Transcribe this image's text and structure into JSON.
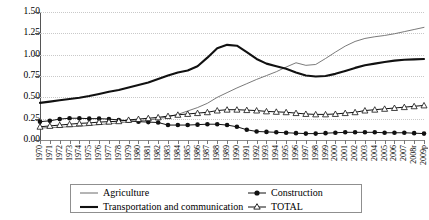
{
  "chart_data": {
    "type": "line",
    "title": "",
    "xlabel": "",
    "ylabel": "",
    "ylim": [
      0.0,
      1.5
    ],
    "yticks": [
      "0.00",
      "0.25",
      "0.50",
      "0.75",
      "1.00",
      "1.25",
      "1.50"
    ],
    "ytick_values": [
      0.0,
      0.25,
      0.5,
      0.75,
      1.0,
      1.25,
      1.5
    ],
    "grid": true,
    "legend_position": "bottom",
    "categories": [
      "1970",
      "1971",
      "1972",
      "1973",
      "1974",
      "1975",
      "1976",
      "1977",
      "1978",
      "1979",
      "1980",
      "1981",
      "1982",
      "1983",
      "1984",
      "1985",
      "1986",
      "1987",
      "1988",
      "1989",
      "1990",
      "1991",
      "1992",
      "1993",
      "1994",
      "1995",
      "1996",
      "1997",
      "1998",
      "1999",
      "2000",
      "2001",
      "2002",
      "2003",
      "2004",
      "2005",
      "2006",
      "2007",
      "2008r",
      "2009p"
    ],
    "series": [
      {
        "name": "Agriculture",
        "style": "thin-line",
        "color": "#6b6b6b",
        "marker": "none",
        "values": [
          0.14,
          0.145,
          0.15,
          0.155,
          0.16,
          0.17,
          0.18,
          0.19,
          0.2,
          0.215,
          0.225,
          0.235,
          0.25,
          0.27,
          0.3,
          0.34,
          0.38,
          0.43,
          0.5,
          0.555,
          0.61,
          0.66,
          0.71,
          0.755,
          0.8,
          0.855,
          0.905,
          0.875,
          0.885,
          0.955,
          1.03,
          1.1,
          1.155,
          1.19,
          1.21,
          1.225,
          1.245,
          1.27,
          1.295,
          1.32
        ]
      },
      {
        "name": "Construction",
        "style": "line-marker",
        "color": "#111111",
        "marker": "filled-circle",
        "values": [
          0.215,
          0.225,
          0.245,
          0.255,
          0.255,
          0.25,
          0.25,
          0.245,
          0.235,
          0.225,
          0.215,
          0.21,
          0.205,
          0.175,
          0.175,
          0.175,
          0.18,
          0.185,
          0.185,
          0.175,
          0.155,
          0.12,
          0.1,
          0.095,
          0.09,
          0.085,
          0.08,
          0.075,
          0.075,
          0.08,
          0.085,
          0.09,
          0.09,
          0.09,
          0.09,
          0.085,
          0.085,
          0.085,
          0.08,
          0.075
        ]
      },
      {
        "name": "Transportation and communication",
        "style": "thick-line",
        "color": "#111111",
        "marker": "none",
        "values": [
          0.435,
          0.45,
          0.465,
          0.48,
          0.495,
          0.515,
          0.54,
          0.565,
          0.585,
          0.615,
          0.645,
          0.675,
          0.715,
          0.755,
          0.79,
          0.815,
          0.865,
          0.965,
          1.075,
          1.115,
          1.105,
          1.03,
          0.95,
          0.895,
          0.865,
          0.835,
          0.79,
          0.755,
          0.745,
          0.75,
          0.775,
          0.81,
          0.845,
          0.875,
          0.895,
          0.915,
          0.93,
          0.94,
          0.945,
          0.95
        ]
      },
      {
        "name": "TOTAL",
        "style": "line-marker",
        "color": "#111111",
        "marker": "open-triangle",
        "values": [
          0.155,
          0.165,
          0.175,
          0.185,
          0.195,
          0.2,
          0.21,
          0.215,
          0.22,
          0.235,
          0.245,
          0.255,
          0.265,
          0.28,
          0.295,
          0.305,
          0.315,
          0.325,
          0.345,
          0.355,
          0.355,
          0.35,
          0.345,
          0.335,
          0.33,
          0.325,
          0.315,
          0.305,
          0.3,
          0.3,
          0.305,
          0.315,
          0.325,
          0.345,
          0.355,
          0.365,
          0.375,
          0.385,
          0.395,
          0.405
        ]
      }
    ]
  },
  "legend": {
    "items": [
      {
        "label": "Agriculture",
        "marker": "thin-line"
      },
      {
        "label": "Construction",
        "marker": "filled-circle"
      },
      {
        "label": "Transportation and communication",
        "marker": "thick-line"
      },
      {
        "label": "TOTAL",
        "marker": "open-triangle"
      }
    ]
  }
}
